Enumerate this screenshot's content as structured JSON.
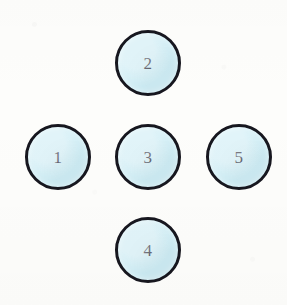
{
  "diagram": {
    "canvas": {
      "width": 287,
      "height": 305
    },
    "style": {
      "background_color": "#fdfdfb",
      "node_fill_color": "#cfeef6",
      "node_border_color": "#17171f",
      "node_border_width_px": 3,
      "label_color": "#262634",
      "node_diameter_px": 66
    },
    "nodes": [
      {
        "id": "node-1",
        "label": "1",
        "position": "left",
        "cx": 58,
        "cy": 157
      },
      {
        "id": "node-2",
        "label": "2",
        "position": "top",
        "cx": 148,
        "cy": 63
      },
      {
        "id": "node-3",
        "label": "3",
        "position": "center",
        "cx": 148,
        "cy": 157
      },
      {
        "id": "node-4",
        "label": "4",
        "position": "bottom",
        "cx": 148,
        "cy": 250
      },
      {
        "id": "node-5",
        "label": "5",
        "position": "right",
        "cx": 239,
        "cy": 157
      }
    ]
  }
}
